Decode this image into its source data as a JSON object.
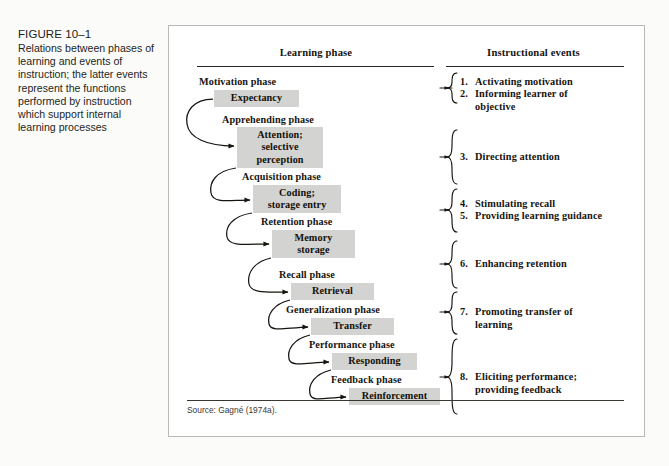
{
  "caption": {
    "figure_label": "FIGURE 10–1",
    "description": "Relations between phases of learning and events of instruction; the latter events represent the functions performed by instruction which support internal learning processes"
  },
  "diagram": {
    "columns": {
      "learning_phase_heading": "Learning phase",
      "instructional_events_heading": "Instructional events"
    },
    "phases": [
      {
        "phase_label": "Motivation phase",
        "box_label": "Expectancy",
        "box_lines": [
          "Expectancy"
        ]
      },
      {
        "phase_label": "Apprehending phase",
        "box_label": "Attention; selective perception",
        "box_lines": [
          "Attention;",
          "selective",
          "perception"
        ]
      },
      {
        "phase_label": "Acquisition phase",
        "box_label": "Coding; storage entry",
        "box_lines": [
          "Coding;",
          "storage entry"
        ]
      },
      {
        "phase_label": "Retention phase",
        "box_label": "Memory storage",
        "box_lines": [
          "Memory",
          "storage"
        ]
      },
      {
        "phase_label": "Recall phase",
        "box_label": "Retrieval",
        "box_lines": [
          "Retrieval"
        ]
      },
      {
        "phase_label": "Generalization phase",
        "box_label": "Transfer",
        "box_lines": [
          "Transfer"
        ]
      },
      {
        "phase_label": "Performance phase",
        "box_label": "Responding",
        "box_lines": [
          "Responding"
        ]
      },
      {
        "phase_label": "Feedback phase",
        "box_label": "Reinforcement",
        "box_lines": [
          "Reinforcement"
        ]
      }
    ],
    "events": [
      {
        "number": "1.",
        "text": "Activating motivation"
      },
      {
        "number": "2.",
        "text": "Informing learner of\nobjective"
      },
      {
        "number": "3.",
        "text": "Directing attention"
      },
      {
        "number": "4.",
        "text": "Stimulating recall"
      },
      {
        "number": "5.",
        "text": "Providing learning guidance"
      },
      {
        "number": "6.",
        "text": "Enhancing retention"
      },
      {
        "number": "7.",
        "text": "Promoting transfer of\nlearning"
      },
      {
        "number": "8.",
        "text": "Eliciting performance;\nproviding feedback"
      }
    ],
    "source": "Source: Gagné (1974a).",
    "colors": {
      "box_fill": "#d3d3d1",
      "rule": "#2b2823",
      "text": "#17140f",
      "panel_border": "#b9b9b7"
    }
  }
}
